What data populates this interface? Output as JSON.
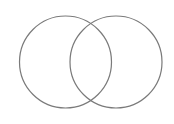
{
  "diagram": {
    "type": "venn",
    "background": "#ffffff",
    "stroke_color": "#7a7a7a",
    "stroke_width": 1.2,
    "sets": [
      {
        "id": "set-a",
        "label": "",
        "cx": 65.5,
        "cy": 62,
        "r": 46
      },
      {
        "id": "set-b",
        "label": "",
        "cx": 116,
        "cy": 62,
        "r": 46
      }
    ]
  }
}
